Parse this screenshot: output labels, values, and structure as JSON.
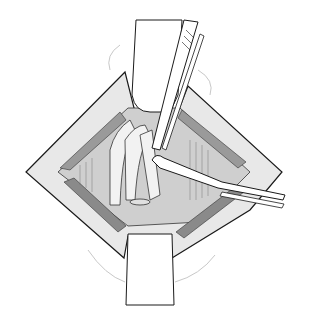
{
  "image": {
    "kind": "surgical line illustration",
    "background": "#ffffff",
    "colors": {
      "line": "#1a1a1a",
      "tissue_light": "#e6e6e6",
      "tissue_mid": "#b8b8b8",
      "tissue_dark": "#7a7a7a",
      "cavity": "#d4d4d4",
      "retractor": "#ffffff"
    },
    "elements": [
      "incision-wound",
      "top-retractor",
      "bottom-retractor",
      "forceps-upper",
      "dissector-lower",
      "exposed-structures"
    ]
  }
}
